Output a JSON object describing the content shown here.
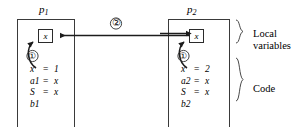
{
  "figure": {
    "title": "",
    "colors": {
      "line": "#2b2b2b",
      "panel_border": "#3a3a3a",
      "text": "#000000",
      "background": "#ffffff"
    }
  },
  "processes": [
    {
      "id": "p1",
      "label": "p",
      "subscript": "1",
      "variable_box": {
        "name": "x-box-p1",
        "label": "x"
      },
      "step_marker": "①",
      "code_lines": [
        {
          "lhs": "x",
          "op": "=",
          "rhs": "1"
        },
        {
          "lhs": "a1",
          "op": "=",
          "rhs": "x"
        },
        {
          "lhs": "S",
          "op": "",
          "rhs": ""
        },
        {
          "lhs": "b1",
          "op": "=",
          "rhs": "x"
        }
      ]
    },
    {
      "id": "p2",
      "label": "p",
      "subscript": "2",
      "variable_box": {
        "name": "x-box-p2",
        "label": "x"
      },
      "step_marker": "①",
      "code_lines": [
        {
          "lhs": "x",
          "op": "=",
          "rhs": "2"
        },
        {
          "lhs": "a2",
          "op": "=",
          "rhs": "x"
        },
        {
          "lhs": "S",
          "op": "",
          "rhs": ""
        },
        {
          "lhs": "b2",
          "op": "=",
          "rhs": "x"
        }
      ]
    }
  ],
  "transfer_arrow": {
    "marker": "②",
    "direction": "bidirectional"
  },
  "section_labels": [
    {
      "id": "local-variables",
      "line1": "Local",
      "line2": "variables"
    },
    {
      "id": "code",
      "line1": "Code",
      "line2": ""
    }
  ]
}
